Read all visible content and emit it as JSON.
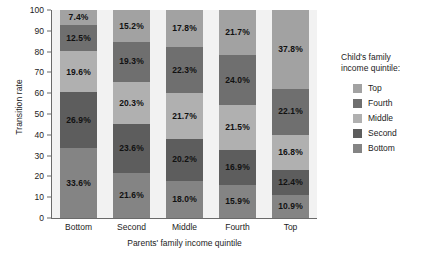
{
  "chart_data": {
    "type": "bar",
    "stacked": true,
    "title": "",
    "subtitle": "",
    "xlabel": "Parents' family income quintile",
    "ylabel": "Transition rate",
    "ylim": [
      0,
      100
    ],
    "yticks": [
      0,
      10,
      20,
      30,
      40,
      50,
      60,
      70,
      80,
      90,
      100
    ],
    "grid": false,
    "legend_position": "right",
    "legend_title_lines": [
      "Child's family",
      "income quintile:"
    ],
    "categories": [
      "Bottom",
      "Second",
      "Middle",
      "Fourth",
      "Top"
    ],
    "series": [
      {
        "name": "Bottom",
        "color": "#848484",
        "values": [
          33.6,
          21.6,
          18.0,
          15.9,
          10.9
        ],
        "labels": [
          "33.6%",
          "21.6%",
          "18.0%",
          "15.9%",
          "10.9%"
        ]
      },
      {
        "name": "Second",
        "color": "#5d5d5d",
        "values": [
          26.9,
          23.6,
          20.2,
          16.9,
          12.4
        ],
        "labels": [
          "26.9%",
          "23.6%",
          "20.2%",
          "16.9%",
          "12.4%"
        ]
      },
      {
        "name": "Middle",
        "color": "#b0b0b0",
        "values": [
          19.6,
          20.3,
          21.7,
          21.5,
          16.8
        ],
        "labels": [
          "19.6%",
          "20.3%",
          "21.7%",
          "21.5%",
          "16.8%"
        ]
      },
      {
        "name": "Fourth",
        "color": "#6f6f6f",
        "values": [
          12.5,
          19.3,
          22.3,
          24.0,
          22.1
        ],
        "labels": [
          "12.5%",
          "19.3%",
          "22.3%",
          "24.0%",
          "22.1%"
        ]
      },
      {
        "name": "Top",
        "color": "#a2a2a2",
        "values": [
          7.4,
          15.2,
          17.8,
          21.7,
          37.8
        ],
        "labels": [
          "7.4%",
          "15.2%",
          "17.8%",
          "21.7%",
          "37.8%"
        ]
      }
    ],
    "legend_entries": [
      {
        "label": "Top",
        "color": "#a2a2a2"
      },
      {
        "label": "Fourth",
        "color": "#6f6f6f"
      },
      {
        "label": "Middle",
        "color": "#b0b0b0"
      },
      {
        "label": "Second",
        "color": "#5d5d5d"
      },
      {
        "label": "Bottom",
        "color": "#848484"
      }
    ]
  },
  "axes": {
    "y_title": "Transition rate",
    "x_title": "Parents' family income quintile",
    "y_tick_labels": [
      "0",
      "10",
      "20",
      "30",
      "40",
      "50",
      "60",
      "70",
      "80",
      "90",
      "100"
    ],
    "x_tick_labels": [
      "Bottom",
      "Second",
      "Middle",
      "Fourth",
      "Top"
    ]
  },
  "legend": {
    "title_line_1": "Child's family",
    "title_line_2": "income quintile:"
  },
  "colors": {
    "plot_background": "#f2f2f2",
    "page_background": "#ffffff",
    "axis": "#6a6a6a",
    "text": "#1c1c1c"
  }
}
